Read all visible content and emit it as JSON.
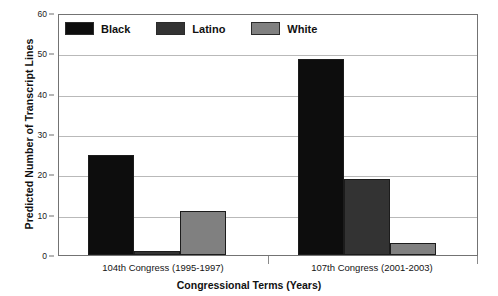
{
  "chart_data": {
    "type": "bar",
    "title": "",
    "xlabel": "Congressional Terms (Years)",
    "ylabel": "Predicted Number of Transcript Lines",
    "categories": [
      "104th Congress (1995-1997)",
      "107th Congress (2001-2003)"
    ],
    "series": [
      {
        "name": "Black",
        "values": [
          25,
          49
        ],
        "color": "#0d0d0d"
      },
      {
        "name": "Latino",
        "values": [
          1,
          19
        ],
        "color": "#333333"
      },
      {
        "name": "White",
        "values": [
          11,
          3
        ],
        "color": "#808080"
      }
    ],
    "ylim": [
      0,
      60
    ],
    "yticks": [
      0,
      10,
      20,
      30,
      40,
      50,
      60
    ],
    "ytick_labels": [
      "0",
      "10",
      "20",
      "30",
      "40",
      "50",
      "60"
    ],
    "grid": true,
    "legend_position": "top-left-inside"
  },
  "legend": {
    "entries": [
      {
        "label": "Black",
        "swatch_color": "#0d0d0d"
      },
      {
        "label": "Latino",
        "swatch_color": "#333333"
      },
      {
        "label": "White",
        "swatch_color": "#808080"
      }
    ]
  },
  "axes": {
    "y_title": "Predicted Number of Transcript Lines",
    "x_title": "Congressional Terms (Years)",
    "y_tick_labels": [
      "60",
      "50",
      "40",
      "30",
      "20",
      "10",
      "0"
    ],
    "x_group_labels": [
      "104th Congress (1995-1997)",
      "107th Congress (2001-2003)"
    ]
  },
  "colors": {
    "frame": "#737373",
    "grid": "#b9b9b9",
    "bar_outline": "#1c1c1c",
    "text": "#111111",
    "background": "#ffffff"
  }
}
